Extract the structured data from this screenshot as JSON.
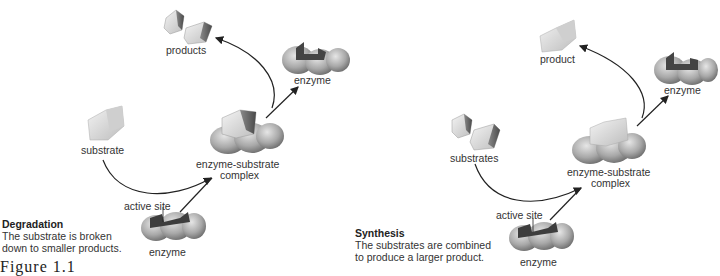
{
  "left_panel": {
    "labels": {
      "products": "products",
      "enzyme_top": "enzyme",
      "substrate": "substrate",
      "complex_line1": "enzyme-substrate",
      "complex_line2": "complex",
      "active_site": "active site",
      "enzyme_bottom": "enzyme"
    },
    "caption": {
      "title": "Degradation",
      "line1": "The substrate is broken",
      "line2": "down to smaller products."
    }
  },
  "right_panel": {
    "labels": {
      "product": "product",
      "enzyme_top": "enzyme",
      "substrates": "substrates",
      "complex_line1": "enzyme-substrate",
      "complex_line2": "complex",
      "active_site": "active site",
      "enzyme_bottom": "enzyme"
    },
    "caption": {
      "title": "Synthesis",
      "line1": "The substrates are combined",
      "line2": "to produce a larger product."
    }
  },
  "figure_label": "Figure 1.1"
}
